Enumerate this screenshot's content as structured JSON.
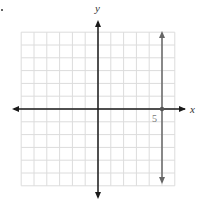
{
  "chart_data": {
    "type": "line",
    "title": "",
    "xlabel": "x",
    "ylabel": "y",
    "xlim": [
      -6,
      6
    ],
    "ylim": [
      -6,
      6
    ],
    "grid": true,
    "tick_labels": [
      {
        "axis": "x",
        "value": 5,
        "label": "5"
      }
    ],
    "series": [
      {
        "name": "x = 5",
        "kind": "vertical-line",
        "x": 5,
        "color": "#666666"
      }
    ],
    "points": [
      {
        "x": 5,
        "y": 0
      }
    ]
  },
  "labels": {
    "x_axis": "x",
    "y_axis": "y",
    "tick_5": "5"
  },
  "colors": {
    "grid": "#dcdcdc",
    "axes": "#1a1a1a",
    "line": "#666666"
  }
}
